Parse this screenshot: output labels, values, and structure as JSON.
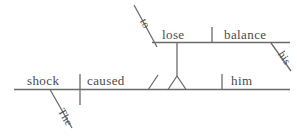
{
  "diagram": {
    "type": "reed-kellogg-sentence-diagram",
    "sentence": "The shock caused him to lose his balance.",
    "line_color": "#6b6b6b",
    "text_color": "#4a4a4a",
    "background_color": "#ffffff",
    "main_clause": {
      "subject": "shock",
      "verb": "caused",
      "object": "him"
    },
    "infinitive_phrase": {
      "particle": "to",
      "verb": "lose",
      "object": "balance"
    },
    "modifiers": {
      "subject_article": "The",
      "object_possessive": "his"
    }
  }
}
